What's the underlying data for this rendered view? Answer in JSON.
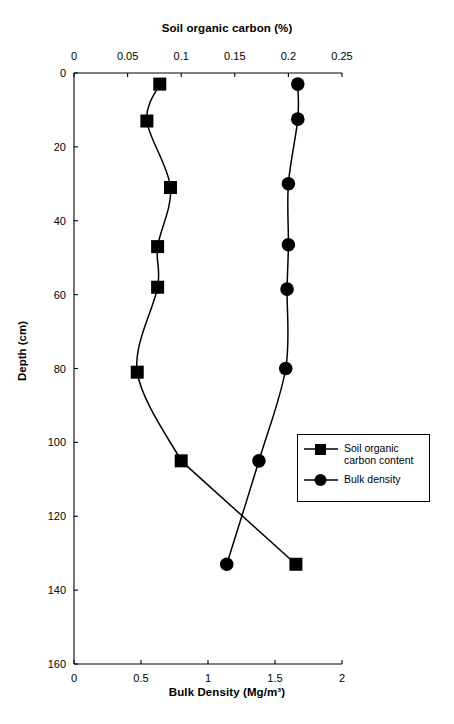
{
  "figure": {
    "top_axis_title": "Soil organic carbon (%)",
    "bottom_axis_title": "Bulk Density (Mg/m³)",
    "left_axis_title": "Depth (cm)"
  },
  "legend": {
    "items": [
      {
        "label": "Soil organic carbon content",
        "marker": "square",
        "color": "#000000"
      },
      {
        "label": "Bulk density",
        "marker": "circle",
        "color": "#000000"
      }
    ]
  },
  "chart_data": {
    "type": "line",
    "title": "",
    "orientation": "vertical-depth-profile",
    "grid": false,
    "legend_position": "center-right",
    "axes": {
      "top": {
        "label": "Soil organic carbon (%)",
        "ticks": [
          0,
          0.05,
          0.1,
          0.15,
          0.2,
          0.25
        ],
        "tick_labels": [
          "0",
          "0.05",
          "0.1",
          "0.15",
          "0.2",
          "0.25"
        ],
        "range": [
          0,
          0.25
        ]
      },
      "bottom": {
        "label": "Bulk Density (Mg/m³)",
        "ticks": [
          0,
          0.5,
          1,
          1.5,
          2
        ],
        "tick_labels": [
          "0",
          "0.5",
          "1",
          "1.5",
          "2"
        ],
        "range": [
          0,
          2
        ]
      },
      "left": {
        "label": "Depth (cm)",
        "ticks": [
          0,
          20,
          40,
          60,
          80,
          100,
          120,
          140,
          160
        ],
        "tick_labels": [
          "0",
          "20",
          "40",
          "60",
          "80",
          "100",
          "120",
          "140",
          "160"
        ],
        "range": [
          0,
          160
        ],
        "inverted": true
      }
    },
    "series": [
      {
        "name": "Soil organic carbon content",
        "marker": "square",
        "color": "#000000",
        "x_axis": "top",
        "xlabel": "Soil organic carbon (%)",
        "ylabel": "Depth (cm)",
        "depth_cm": [
          3,
          13,
          31,
          47,
          58,
          81,
          105,
          133
        ],
        "values": [
          0.08,
          0.068,
          0.09,
          0.078,
          0.078,
          0.059,
          0.1,
          0.207
        ]
      },
      {
        "name": "Bulk density",
        "marker": "circle",
        "color": "#000000",
        "x_axis": "bottom",
        "xlabel": "Bulk Density (Mg/m³)",
        "ylabel": "Depth (cm)",
        "depth_cm": [
          3,
          12.5,
          30,
          46.5,
          58.5,
          80,
          105,
          133
        ],
        "values": [
          1.67,
          1.67,
          1.6,
          1.6,
          1.59,
          1.58,
          1.38,
          1.14
        ]
      }
    ]
  }
}
